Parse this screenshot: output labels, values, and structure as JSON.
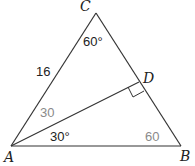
{
  "diagram": {
    "type": "triangle",
    "vertices": {
      "A": {
        "label": "A",
        "x": 11,
        "y": 146
      },
      "B": {
        "label": "B",
        "x": 181,
        "y": 146
      },
      "C": {
        "label": "C",
        "x": 96,
        "y": 13
      },
      "D": {
        "label": "D",
        "x": 139,
        "y": 82
      }
    },
    "segments": [
      "AC",
      "CB",
      "AB",
      "AD"
    ],
    "right_angle_at": "D",
    "labels": {
      "vertex_C": "C",
      "vertex_A": "A",
      "vertex_B": "B",
      "vertex_D": "D",
      "side_AC": "16",
      "angle_C": "60°",
      "angle_CAD": "30",
      "angle_DAB": "30°",
      "angle_B": "60"
    },
    "colors": {
      "line": "#333333",
      "label": "#222222",
      "derived_label": "#8a8a8a"
    }
  }
}
